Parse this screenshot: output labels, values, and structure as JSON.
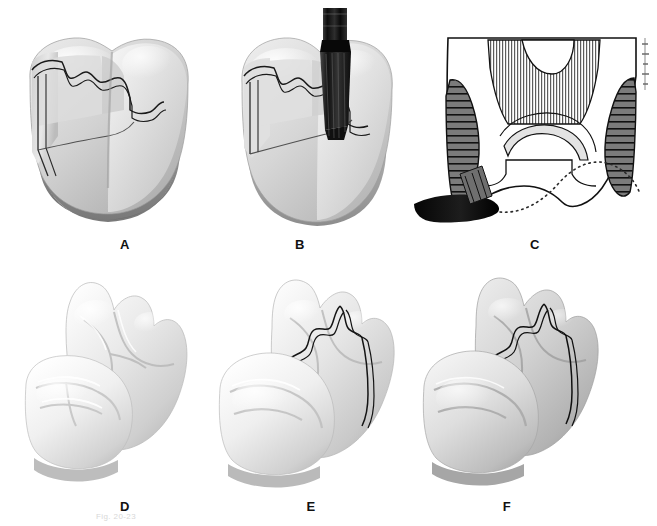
{
  "figure": {
    "background_color": "#ffffff",
    "width": 657,
    "height": 526,
    "caption": "Fig. 20-23"
  },
  "panels": [
    {
      "id": "A",
      "label": "A",
      "name": "panel-a-prepared-molar",
      "description": "Shaded three-dimensional molar with outlined proximal box preparation on the mesial surface",
      "label_x": 110,
      "label_y": 237
    },
    {
      "id": "B",
      "label": "B",
      "name": "panel-b-molar-with-bur",
      "description": "Same molar with a dark tapered rotary bur inserted into the occlusal isthmus of the preparation",
      "label_x": 285,
      "label_y": 237
    },
    {
      "id": "C",
      "label": "C",
      "name": "panel-c-cross-section",
      "description": "Line-art buccolingual cross section: vertically hatched dentin core, horizontally hatched enamel walls, dark bur at the gingival floor and a dotted outline of the original tooth contour",
      "label_x": 520,
      "label_y": 237
    },
    {
      "id": "D",
      "label": "D",
      "name": "panel-d-unprepared-models",
      "description": "Two light stone tooth models in proximal contact, no preparation outlines",
      "label_x": 110,
      "label_y": 499
    },
    {
      "id": "E",
      "label": "E",
      "name": "panel-e-outlined-models",
      "description": "Two tooth models with the preparation outline drawn on the occlusal and proximal surfaces of the distal tooth",
      "label_x": 296,
      "label_y": 499
    },
    {
      "id": "F",
      "label": "F",
      "name": "panel-f-outlined-models-shaded",
      "description": "Same outlined tooth models viewed in a darker shaded rendering",
      "label_x": 492,
      "label_y": 499
    }
  ],
  "palette": {
    "background": "#ffffff",
    "ink": "#111111",
    "outline": "#1a1a1a",
    "enamel_light": "#f2f2f2",
    "enamel_mid": "#d9d9d9",
    "dentin_shadow": "#b4b4b4",
    "root_gray": "#8d8d8d",
    "deep_shadow": "#5f5f5f",
    "hatch_gray": "#7c7c7c",
    "bur_dark": "#1b1b1b",
    "model_light": "#f0f0f0",
    "model_mid": "#cfcfcf",
    "model_dark": "#a8a8a8",
    "caption_faint": "#d8d8d8"
  }
}
